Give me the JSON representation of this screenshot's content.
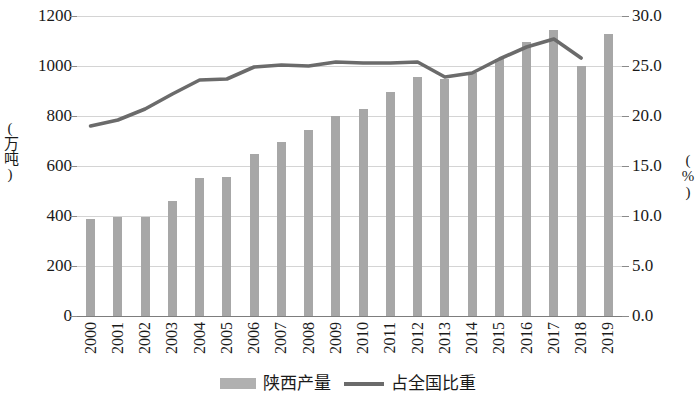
{
  "chart_data": {
    "type": "bar",
    "title": "",
    "subtitle": "",
    "xlabel": "",
    "ylabel": "(万吨)",
    "y2label": "(%)",
    "grid": true,
    "legend_position": "bottom",
    "categories": [
      "2000",
      "2001",
      "2002",
      "2003",
      "2004",
      "2005",
      "2006",
      "2007",
      "2008",
      "2009",
      "2010",
      "2011",
      "2012",
      "2013",
      "2014",
      "2015",
      "2016",
      "2017",
      "2018",
      "2019"
    ],
    "ylim": [
      0,
      1200
    ],
    "yticks": [
      "0",
      "200",
      "400",
      "600",
      "800",
      "1000",
      "1200"
    ],
    "y2lim": [
      0,
      30
    ],
    "y2ticks": [
      "0.0",
      "5.0",
      "10.0",
      "15.0",
      "20.0",
      "25.0",
      "30.0"
    ],
    "series": [
      {
        "name": "陕西产量",
        "type": "bar",
        "axis": "left",
        "unit": "万吨",
        "color": "#a7a7a7",
        "values": [
          390,
          398,
          395,
          462,
          552,
          558,
          650,
          695,
          745,
          800,
          830,
          898,
          958,
          950,
          972,
          1030,
          1098,
          1145,
          1000,
          1130
        ]
      },
      {
        "name": "占全国比重",
        "type": "line",
        "axis": "right",
        "unit": "%",
        "color": "#6b6b6b",
        "values": [
          19.0,
          19.6,
          20.7,
          22.2,
          23.6,
          23.7,
          24.9,
          25.1,
          25.0,
          25.4,
          25.3,
          25.3,
          25.4,
          23.9,
          24.3,
          25.7,
          26.9,
          27.7,
          25.8,
          null
        ]
      }
    ]
  },
  "legend": [
    {
      "label": "陕西产量",
      "marker": "bar-swatch"
    },
    {
      "label": "占全国比重",
      "marker": "line-swatch"
    }
  ]
}
